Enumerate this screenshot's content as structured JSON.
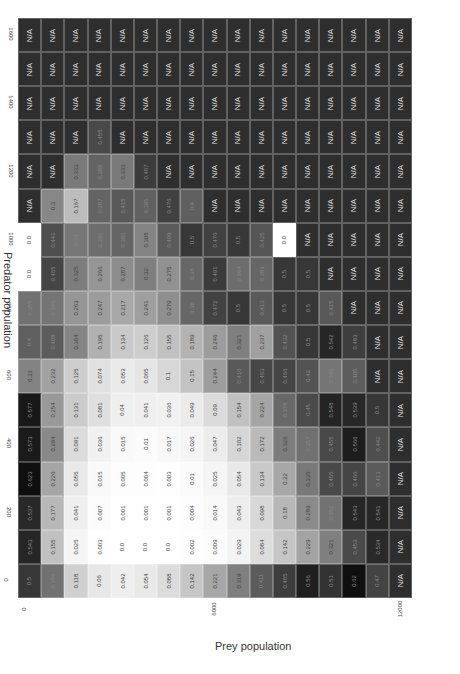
{
  "chart_data": {
    "type": "heatmap",
    "title": "",
    "xlabel": "Prey population",
    "ylabel": "Predator population",
    "x_ticks": [
      "0",
      "2000",
      "4000",
      "6000",
      "8000",
      "10000",
      "12000"
    ],
    "y_ticks": [
      "1600",
      "1400",
      "1200",
      "1000",
      "800",
      "600",
      "400",
      "200",
      "0"
    ],
    "x": [
      0,
      750,
      1500,
      2250,
      3000,
      3750,
      4500,
      5250,
      6000,
      6750,
      7500,
      8250,
      9000,
      9750,
      10500,
      11250,
      12000
    ],
    "y": [
      1600,
      1500,
      1400,
      1300,
      1200,
      1100,
      1000,
      900,
      800,
      700,
      600,
      500,
      400,
      300,
      200,
      100,
      0
    ],
    "na_label": "N/A",
    "colormap": "grayscale (dark = high/invalid, light = low)",
    "values": [
      [
        "N/A",
        "N/A",
        "N/A",
        "N/A",
        "N/A",
        "N/A",
        "N/A",
        "N/A",
        "N/A",
        "N/A",
        "N/A",
        "N/A",
        "N/A",
        "N/A",
        "N/A",
        "N/A",
        "N/A"
      ],
      [
        "N/A",
        "N/A",
        "N/A",
        "N/A",
        "N/A",
        "N/A",
        "N/A",
        "N/A",
        "N/A",
        "N/A",
        "N/A",
        "N/A",
        "N/A",
        "N/A",
        "N/A",
        "N/A",
        "N/A"
      ],
      [
        "N/A",
        "N/A",
        "N/A",
        "N/A",
        "N/A",
        "N/A",
        "N/A",
        "N/A",
        "N/A",
        "N/A",
        "N/A",
        "N/A",
        "N/A",
        "N/A",
        "N/A",
        "N/A",
        "N/A"
      ],
      [
        "N/A",
        "N/A",
        "N/A",
        "0.455",
        "N/A",
        "N/A",
        "N/A",
        "N/A",
        "N/A",
        "N/A",
        "N/A",
        "N/A",
        "N/A",
        "N/A",
        "N/A",
        "N/A",
        "N/A"
      ],
      [
        "N/A",
        "N/A",
        "0.333",
        "0.388",
        "0.333",
        "0.487",
        "N/A",
        "N/A",
        "N/A",
        "N/A",
        "N/A",
        "N/A",
        "N/A",
        "N/A",
        "N/A",
        "N/A",
        "N/A"
      ],
      [
        "N/A",
        "0.3",
        "0.167",
        "0.387",
        "0.415",
        "0.395",
        "0.476",
        "0.4",
        "N/A",
        "N/A",
        "N/A",
        "N/A",
        "N/A",
        "N/A",
        "N/A",
        "N/A",
        "N/A"
      ],
      [
        "0.0",
        "0.441",
        "0.34",
        "0.366",
        "0.386",
        "0.308",
        "0.409",
        "0.5",
        "0.476",
        "0.5",
        "0.425",
        "0.0",
        "N/A",
        "N/A",
        "N/A",
        "N/A",
        "N/A"
      ],
      [
        "0.0",
        "0.465",
        "0.325",
        "0.266",
        "0.287",
        "0.32",
        "0.275",
        "0.38",
        "0.491",
        "0.364",
        "0.383",
        "0.5",
        "0.5",
        "N/A",
        "N/A",
        "N/A",
        "N/A"
      ],
      [
        "0.355",
        "0.345",
        "0.263",
        "0.247",
        "0.217",
        "0.241",
        "0.279",
        "0.38",
        "0.472",
        "0.5",
        "0.413",
        "0.5",
        "0.5",
        "0.415",
        "N/A",
        "N/A",
        "N/A"
      ],
      [
        "0.4",
        "0.408",
        "0.304",
        "0.195",
        "0.134",
        "0.126",
        "0.155",
        "0.189",
        "0.246",
        "0.321",
        "0.237",
        "0.432",
        "0.5",
        "0.542",
        "0.483",
        "N/A",
        "N/A"
      ],
      [
        "0.31",
        "0.232",
        "0.125",
        "0.074",
        "0.053",
        "0.065",
        "0.1",
        "0.15",
        "0.244",
        "0.416",
        "0.463",
        "0.466",
        "0.43",
        "0.345",
        "0.405",
        "N/A",
        "N/A"
      ],
      [
        "0.577",
        "0.254",
        "0.131",
        "0.081",
        "0.04",
        "0.041",
        "0.036",
        "0.049",
        "0.09",
        "0.154",
        "0.224",
        "0.378",
        "0.45",
        "0.548",
        "0.539",
        "0.5",
        "N/A"
      ],
      [
        "0.573",
        "0.294",
        "0.091",
        "0.036",
        "0.015",
        "0.01",
        "0.017",
        "0.026",
        "0.047",
        "0.102",
        "0.172",
        "0.326",
        "0.357",
        "0.455",
        "0.566",
        "0.442",
        "N/A"
      ],
      [
        "0.623",
        "0.226",
        "0.055",
        "0.015",
        "0.005",
        "0.004",
        "0.003",
        "0.01",
        "0.025",
        "0.054",
        "0.134",
        "0.22",
        "0.335",
        "0.455",
        "0.466",
        "0.413",
        "N/A"
      ],
      [
        "0.537",
        "0.177",
        "0.041",
        "0.007",
        "0.001",
        "0.001",
        "0.001",
        "0.004",
        "0.014",
        "0.043",
        "0.098",
        "0.18",
        "0.289",
        "0.352",
        "0.543",
        "0.541",
        "N/A"
      ],
      [
        "0.543",
        "0.155",
        "0.025",
        "0.003",
        "0.0",
        "0.0",
        "0.0",
        "0.002",
        "0.009",
        "0.029",
        "0.084",
        "0.142",
        "0.229",
        "0.321",
        "0.453",
        "0.534",
        "N/A"
      ],
      [
        "0.5",
        "0.356",
        "0.118",
        "0.06",
        "0.042",
        "0.054",
        "0.088",
        "0.142",
        "0.221",
        "0.319",
        "0.411",
        "0.485",
        "0.56",
        "0.51",
        "0.62",
        "0.47",
        "N/A"
      ]
    ]
  }
}
